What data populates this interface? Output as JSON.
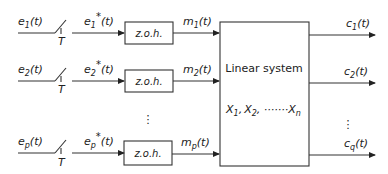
{
  "diagram": {
    "type": "block-diagram",
    "title": "",
    "rows": [
      {
        "input": "e",
        "input_sub": "1",
        "sampled": "e",
        "sampled_sub": "1",
        "hold_label": "z.o.h.",
        "output": "m",
        "output_sub": "1",
        "switch_label": "T"
      },
      {
        "input": "e",
        "input_sub": "2",
        "sampled": "e",
        "sampled_sub": "2",
        "hold_label": "z.o.h.",
        "output": "m",
        "output_sub": "2",
        "switch_label": "T"
      },
      {
        "input": "e",
        "input_sub": "p",
        "sampled": "e",
        "sampled_sub": "p",
        "hold_label": "z.o.h.",
        "output": "m",
        "output_sub": "p",
        "switch_label": "T"
      }
    ],
    "time_arg": "(t)",
    "star": "*",
    "ellipsis": "⋮",
    "system": {
      "label": "Linear system",
      "states": [
        "X",
        "X",
        "X"
      ],
      "state_subs": [
        "1",
        "2",
        "n"
      ],
      "separators": [
        ",",
        ", ·······",
        ""
      ]
    },
    "outputs": [
      {
        "name": "c",
        "sub": "1"
      },
      {
        "name": "c",
        "sub": "2"
      },
      {
        "name": "c",
        "sub": "q"
      }
    ]
  }
}
